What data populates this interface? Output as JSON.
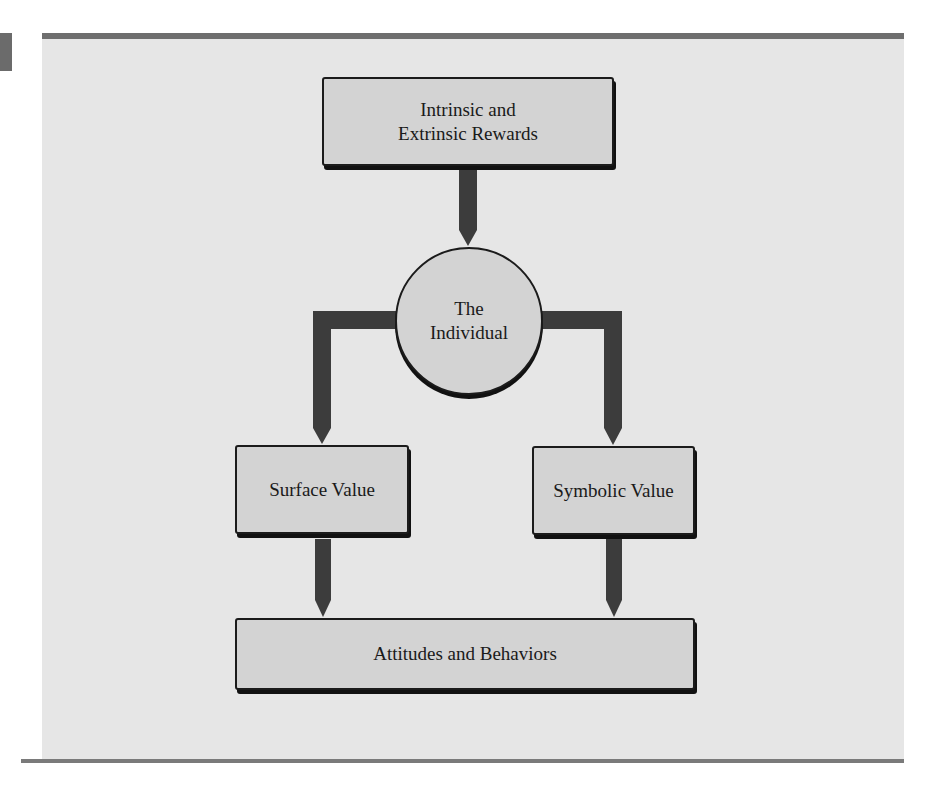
{
  "figure": {
    "nodes": {
      "rewards": {
        "line1": "Intrinsic and",
        "line2": "Extrinsic Rewards"
      },
      "individual": {
        "line1": "The",
        "line2": "Individual"
      },
      "surface_value": {
        "label": "Surface Value"
      },
      "symbolic_value": {
        "label": "Symbolic Value"
      },
      "outcomes": {
        "label": "Attitudes and Behaviors"
      }
    },
    "edges": [
      {
        "from": "Intrinsic and Extrinsic Rewards",
        "to": "The Individual"
      },
      {
        "from": "The Individual",
        "to": "Surface Value"
      },
      {
        "from": "The Individual",
        "to": "Symbolic Value"
      },
      {
        "from": "Surface Value",
        "to": "Attitudes and Behaviors"
      },
      {
        "from": "Symbolic Value",
        "to": "Attitudes and Behaviors"
      }
    ],
    "colors": {
      "panel_background": "#e6e6e6",
      "node_fill": "#d3d3d3",
      "node_border": "#1b1b1b",
      "connector": "#3c3c3c",
      "rule": "#6e6e6e"
    }
  }
}
